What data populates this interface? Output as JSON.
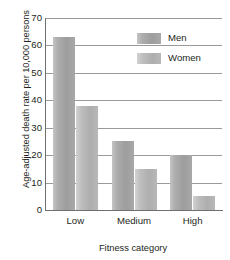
{
  "chart_data": {
    "type": "bar",
    "title": "",
    "xlabel": "Fitness category",
    "ylabel": "Age-adjusted death rate per 10,000 persons",
    "categories": [
      "Low",
      "Medium",
      "High"
    ],
    "series": [
      {
        "name": "Men",
        "values": [
          63,
          25,
          20
        ],
        "color": "#a8a8a8"
      },
      {
        "name": "Women",
        "values": [
          38,
          15,
          5
        ],
        "color": "#bdbdbd"
      }
    ],
    "ylim": [
      0,
      70
    ],
    "yticks": [
      0,
      10,
      20,
      30,
      40,
      50,
      60,
      70
    ],
    "ytick_labels": [
      "0",
      "10",
      "20",
      "30",
      "40",
      "50",
      "60",
      "70"
    ],
    "grid": true,
    "grid_axis": "y",
    "legend_position": "top-right"
  },
  "legend": {
    "entries": [
      {
        "label": "Men"
      },
      {
        "label": "Women"
      }
    ]
  },
  "axes": {
    "x_title": "Fitness category",
    "y_title": "Age-adjusted death rate per 10,000 persons"
  }
}
